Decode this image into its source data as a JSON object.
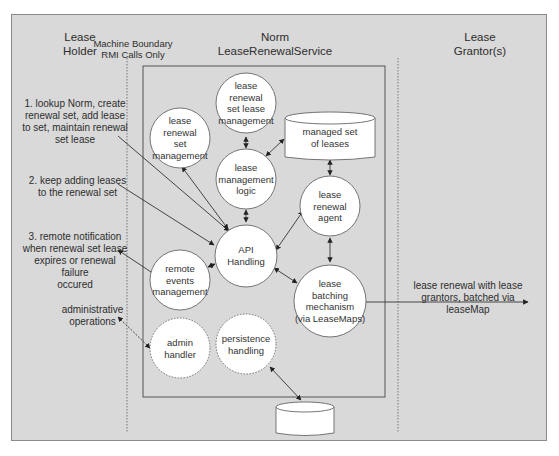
{
  "columns": {
    "lease_holder": {
      "line1": "Lease",
      "line2": "Holder"
    },
    "machine_boundary": {
      "line1": "Machine Boundary",
      "line2": "RMI Calls Only"
    },
    "norm_service": {
      "line1": "Norm",
      "line2": "LeaseRenewalService"
    },
    "lease_grantors": {
      "line1": "Lease",
      "line2": "Grantor(s)"
    }
  },
  "annotations": {
    "step1": [
      "1. lookup Norm, create",
      "renewal set, add lease",
      "to set, maintain renewal",
      "set lease"
    ],
    "step2": [
      "2. keep adding leases",
      "to the renewal set"
    ],
    "step3": [
      "3. remote notification",
      "when renewal set lease",
      "expires or renewal failure",
      "occured"
    ],
    "admin_ops": [
      "administrative",
      "operations"
    ],
    "batch_out": [
      "lease renewal with lease",
      "grantors, batched via leaseMap"
    ]
  },
  "nodes": {
    "renewal_set_mgmt": [
      "lease",
      "renewal",
      "set",
      "management"
    ],
    "renewal_set_lease_mgmt": [
      "lease",
      "renewal",
      "set lease",
      "management"
    ],
    "lease_mgmt_logic": [
      "lease",
      "management",
      "logic"
    ],
    "managed_set": [
      "managed set",
      "of leases"
    ],
    "renewal_agent": [
      "lease",
      "renewal",
      "agent"
    ],
    "api_handling": [
      "API",
      "Handling"
    ],
    "remote_events": [
      "remote",
      "events",
      "management"
    ],
    "batching": [
      "lease",
      "batching",
      "mechanism",
      "(via LeaseMaps)"
    ],
    "admin_handler": [
      "admin",
      "handler"
    ],
    "persistence": [
      "persistence",
      "handling"
    ]
  },
  "colors": {
    "background": "#d9d9d9",
    "node_fill": "#ffffff",
    "line": "#333333",
    "frame": "#8a8a8a"
  }
}
